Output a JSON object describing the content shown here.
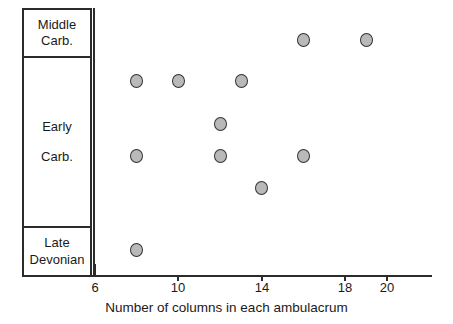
{
  "chart_data": {
    "type": "scatter",
    "title": "",
    "xlabel": "Number of columns in each ambulacrum",
    "ylabel": "",
    "xlim": [
      5,
      20.6
    ],
    "xticks": [
      6,
      10,
      14,
      18,
      20
    ],
    "xtick_labels": [
      "6",
      "10",
      "14",
      "18",
      "20"
    ],
    "grid": false,
    "legend": null,
    "y_categories": [
      {
        "id": "middle-carb",
        "lines": [
          "Middle",
          "Carb."
        ],
        "label": "Middle Carb."
      },
      {
        "id": "early-carb",
        "lines": [
          "Early",
          "Carb."
        ],
        "label": "Early Carb."
      },
      {
        "id": "late-devonian",
        "lines": [
          "Late",
          "Devonian"
        ],
        "label": "Late Devonian"
      }
    ],
    "points": [
      {
        "x": 16,
        "category": "Middle Carb.",
        "row": 0
      },
      {
        "x": 19,
        "category": "Middle Carb.",
        "row": 0
      },
      {
        "x": 8,
        "category": "Early Carb.",
        "row": 1
      },
      {
        "x": 10,
        "category": "Early Carb.",
        "row": 1
      },
      {
        "x": 13,
        "category": "Early Carb.",
        "row": 1
      },
      {
        "x": 12,
        "category": "Early Carb.",
        "row": 2
      },
      {
        "x": 12,
        "category": "Early Carb.",
        "row": 3
      },
      {
        "x": 8,
        "category": "Early Carb.",
        "row": 3
      },
      {
        "x": 16,
        "category": "Early Carb.",
        "row": 3
      },
      {
        "x": 14,
        "category": "Early Carb.",
        "row": 4
      },
      {
        "x": 8,
        "category": "Late Devonian",
        "row": 5
      }
    ],
    "marker": {
      "shape": "circle",
      "fill": "#b9b9b9",
      "edge": "#333333"
    },
    "colors": {
      "axis": "#2b2b2b",
      "text": "#1a1a1a",
      "background": "#ffffff"
    }
  }
}
